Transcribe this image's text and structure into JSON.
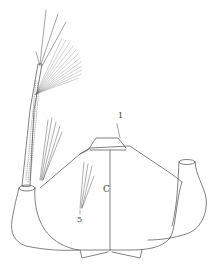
{
  "figure": {
    "type": "scientific line drawing",
    "stroke_color": "#4a4a4a",
    "background": "#ffffff",
    "labels": {
      "seta_1": "1",
      "segment_c": "C",
      "seta_5": "5"
    }
  }
}
